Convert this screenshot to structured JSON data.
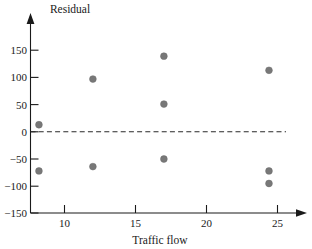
{
  "chart_data": {
    "type": "scatter",
    "title": "",
    "xlabel": "Traffic flow",
    "ylabel": "Residual",
    "xlim": [
      7.0,
      27.0
    ],
    "ylim": [
      -150,
      175
    ],
    "grid": false,
    "legend": "none",
    "xticks": [
      10,
      15,
      20,
      25
    ],
    "xtick_labels": [
      "10",
      "15",
      "20",
      "25"
    ],
    "yticks": [
      -150,
      -100,
      -50,
      0,
      50,
      100,
      150
    ],
    "ytick_labels": [
      "−150",
      "−100",
      "−50",
      "0",
      "50",
      "100",
      "150"
    ],
    "reference_line": {
      "orientation": "horizontal",
      "value": 0,
      "style": "dashed",
      "label": ""
    },
    "series": [
      {
        "name": "residuals",
        "color": "#787878",
        "marker": "circle",
        "points": [
          {
            "x": 8.2,
            "y": 13
          },
          {
            "x": 8.2,
            "y": -72
          },
          {
            "x": 12.0,
            "y": 97
          },
          {
            "x": 12.0,
            "y": -64
          },
          {
            "x": 17.0,
            "y": 139
          },
          {
            "x": 17.0,
            "y": 51
          },
          {
            "x": 17.0,
            "y": -50
          },
          {
            "x": 24.4,
            "y": 113
          },
          {
            "x": 24.4,
            "y": -72
          },
          {
            "x": 24.4,
            "y": -95
          }
        ]
      }
    ]
  },
  "axes": {
    "y_axis_label": "Residual",
    "x_axis_label": "Traffic flow"
  }
}
